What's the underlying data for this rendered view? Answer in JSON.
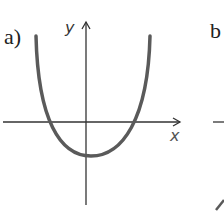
{
  "panels": [
    {
      "label": "a)",
      "axes": {
        "x_label": "x",
        "y_label": "y"
      },
      "curve": {
        "type": "parabola",
        "opens": "up",
        "vertex": "below x-axis, slightly right of y-axis",
        "roots": 2
      }
    },
    {
      "label": "b",
      "note": "partially visible, cropped at right edge"
    }
  ],
  "colors": {
    "curve": "#5a5a5a",
    "axes": "#333333",
    "background": "#ffffff"
  }
}
